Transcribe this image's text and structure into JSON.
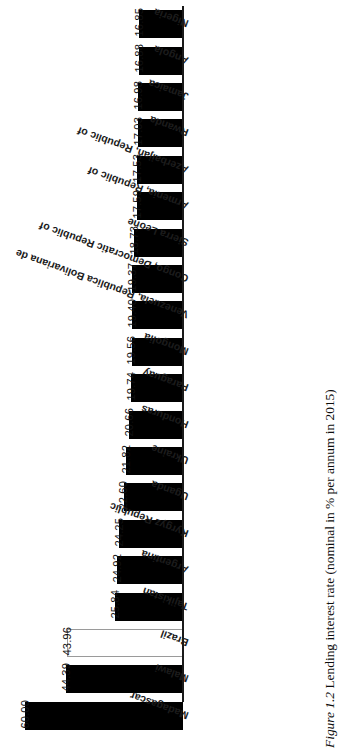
{
  "figure": {
    "caption_number": "Figure 1.2",
    "caption_text": "Lending interest rate (nominal in % per annum in 2015)"
  },
  "chart_data": {
    "type": "bar",
    "orientation": "horizontal",
    "rotated_180": true,
    "title": "Lending interest rate (nominal in % per annum in 2015)",
    "xlabel": "",
    "ylabel": "",
    "xlim": [
      0,
      60
    ],
    "grid": false,
    "legend": "none",
    "value_format": "0.00",
    "categories": [
      "Madagascar",
      "Malawi",
      "Brazil",
      "Tajikistan",
      "Argentina",
      "Kyrgyz Republic",
      "Uganda",
      "Ukraine",
      "Honduras",
      "Paraguay",
      "Mongolia",
      "Venezuela, Republica Bolivariana de",
      "Congo, Democratic Republic of",
      "Sierra Leone",
      "Armenia, Republic of",
      "Azerbaijan, Republic of",
      "Rwanda",
      "Jamaica",
      "Angola",
      "Nigeria"
    ],
    "values": [
      60.0,
      44.39,
      43.96,
      25.84,
      24.92,
      24.25,
      22.6,
      21.82,
      20.66,
      19.74,
      19.56,
      19.4,
      19.37,
      18.73,
      17.59,
      17.53,
      17.03,
      16.98,
      16.88,
      16.85
    ],
    "value_labels": [
      "60.00",
      "44.39",
      "43.96",
      "25.84",
      "24.92",
      "24.25",
      "22.60",
      "21.82",
      "20.66",
      "19.74",
      "19.56",
      "19.40",
      "19.37",
      "18.73",
      "17.59",
      "17.53",
      "17.03",
      "16.98",
      "16.88",
      "16.85"
    ],
    "bar_styles": [
      "filled",
      "filled",
      "unfilled",
      "filled",
      "filled",
      "filled",
      "filled",
      "filled",
      "filled",
      "filled",
      "filled",
      "filled",
      "filled",
      "filled",
      "filled",
      "filled",
      "filled",
      "filled",
      "filled",
      "filled"
    ],
    "colors": {
      "bar_fill": "#000000",
      "bar_unfilled_fill": "#ffffff",
      "bar_unfilled_border": "#9a9a9a",
      "axis": "#1a1a1a",
      "text": "#111111",
      "background": "#ffffff"
    }
  }
}
